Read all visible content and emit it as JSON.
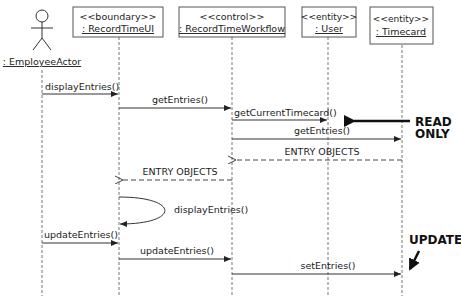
{
  "diagram": {
    "type": "sequence",
    "participants": [
      {
        "id": "actor",
        "kind": "actor",
        "stereotype": "",
        "name": ": EmployeeActor",
        "x": 42
      },
      {
        "id": "ui",
        "kind": "object",
        "stereotype": "<<boundary>>",
        "name": ": RecordTimeUI",
        "x": 119
      },
      {
        "id": "workflow",
        "kind": "object",
        "stereotype": "<<control>>",
        "name": ": RecordTimeWorkflow",
        "x": 232
      },
      {
        "id": "user",
        "kind": "object",
        "stereotype": "<<entity>>",
        "name": ": User",
        "x": 328
      },
      {
        "id": "timecard",
        "kind": "object",
        "stereotype": "<<entity>>",
        "name": ": Timecard",
        "x": 402
      }
    ],
    "messages": [
      {
        "from": "actor",
        "to": "ui",
        "label": "displayEntries()",
        "style": "sync"
      },
      {
        "from": "ui",
        "to": "workflow",
        "label": "getEntries()",
        "style": "sync"
      },
      {
        "from": "workflow",
        "to": "user",
        "label": "getCurrentTimecard()",
        "style": "sync"
      },
      {
        "from": "workflow",
        "to": "timecard",
        "label": "getEntries()",
        "style": "sync"
      },
      {
        "from": "timecard",
        "to": "workflow",
        "label": "ENTRY OBJECTS",
        "style": "return"
      },
      {
        "from": "workflow",
        "to": "ui",
        "label": "ENTRY OBJECTS",
        "style": "return"
      },
      {
        "from": "ui",
        "to": "ui",
        "label": "displayEntries()",
        "style": "self"
      },
      {
        "from": "actor",
        "to": "ui",
        "label": "updateEntries()",
        "style": "sync"
      },
      {
        "from": "ui",
        "to": "workflow",
        "label": "updateEntries()",
        "style": "sync"
      },
      {
        "from": "workflow",
        "to": "timecard",
        "label": "setEntries()",
        "style": "sync"
      }
    ],
    "annotations": [
      {
        "line1": "READ",
        "line2": "ONLY"
      },
      {
        "line1": "UPDATE"
      }
    ]
  }
}
